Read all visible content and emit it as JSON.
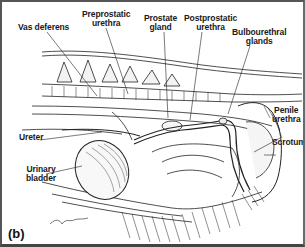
{
  "figure": {
    "panel_label": "(b)",
    "labels": {
      "vas_deferens": "Vas deferens",
      "preprostatic_urethra": [
        "Preprostatic",
        "urethra"
      ],
      "prostate_gland": [
        "Prostate",
        "gland"
      ],
      "postprostatic_urethra": [
        "Postprostatic",
        "urethra"
      ],
      "bulbourethral_glands": [
        "Bulbourethral",
        "glands"
      ],
      "penile_urethra": [
        "Penile",
        "urethra"
      ],
      "scrotum": "Scrotum",
      "ureter": "Ureter",
      "urinary_bladder": [
        "Urinary",
        "bladder"
      ]
    },
    "signature": "Cath"
  },
  "colors": {
    "ink": "#1a1a1a",
    "border": "#555555",
    "background": "#ffffff"
  }
}
